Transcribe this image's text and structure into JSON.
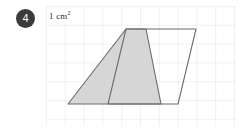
{
  "question": {
    "number": "4"
  },
  "figure": {
    "unit_label_text": "1 cm",
    "unit_label_exponent": "2",
    "grid": {
      "cell_size_px": 18.8,
      "columns": 10,
      "rows": 6,
      "line_color": "#d8dce6",
      "background": "#ffffff"
    },
    "colors": {
      "outline": "#6b6b6b",
      "shade_fill": "#d6d6d6",
      "badge_fill": "#3b3b3b",
      "badge_text": "#ffffff",
      "label_text": "#2e2e2e"
    },
    "shapes": [
      {
        "name": "parallelogram",
        "filled": false,
        "points": "80,23 150,23 132,98 62,98"
      },
      {
        "name": "shaded-trapezoid",
        "filled": true,
        "points": "80,23 100,23 115,98 22,98"
      }
    ]
  }
}
